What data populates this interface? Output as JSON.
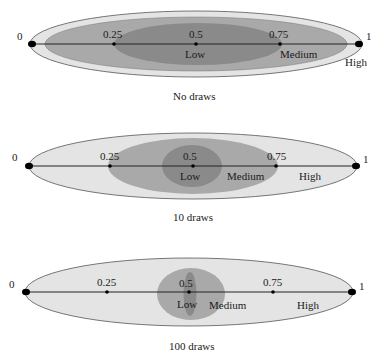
{
  "colors": {
    "light": "#e4e4e4",
    "medium": "#a9a9a9",
    "dark": "#8a8a8a",
    "outline": "#555555",
    "line": "#222222"
  },
  "axis": {
    "min_label": "0",
    "max_label": "1",
    "ticks": [
      "0.25",
      "0.5",
      "0.75"
    ]
  },
  "regions": {
    "low": "Low",
    "medium": "Medium",
    "high": "High"
  },
  "panels": [
    {
      "caption": "No draws"
    },
    {
      "caption": "10 draws"
    },
    {
      "caption": "100 draws"
    }
  ]
}
